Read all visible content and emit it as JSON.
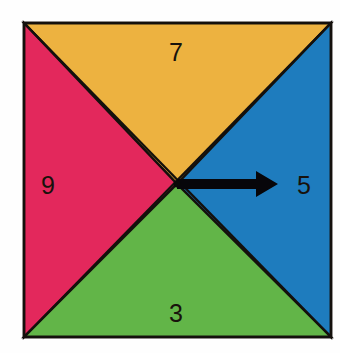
{
  "figure": {
    "background_color": "#fefefe",
    "border_color": "#14100c",
    "square": {
      "x": 24,
      "y": 23,
      "width": 307,
      "height": 314
    },
    "center": {
      "x": 177,
      "y": 184
    },
    "wedges": [
      {
        "id": "top",
        "label": "7",
        "color": "#edb240",
        "label_x": 176,
        "label_y": 52,
        "position": "top"
      },
      {
        "id": "left",
        "label": "9",
        "color": "#e3285c",
        "label_x": 48,
        "label_y": 185,
        "position": "left"
      },
      {
        "id": "right",
        "label": "5",
        "color": "#1e7cbe",
        "label_x": 304,
        "label_y": 185,
        "position": "right"
      },
      {
        "id": "bottom",
        "label": "3",
        "color": "#62b548",
        "label_x": 176,
        "label_y": 313,
        "position": "bottom"
      }
    ],
    "arrow": {
      "name": "direction-arrow",
      "color": "#07060a",
      "direction": "right",
      "from_x": 177,
      "from_y": 184,
      "to_x": 278,
      "shaft_half_height": 5,
      "head_half_height": 13,
      "head_length": 22
    }
  }
}
